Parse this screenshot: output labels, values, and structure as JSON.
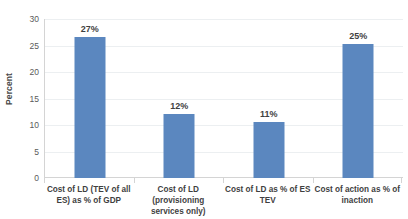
{
  "chart_data": {
    "type": "bar",
    "title": "",
    "xlabel": "",
    "ylabel": "Percent",
    "ylim": [
      0,
      30
    ],
    "yticks": [
      0,
      5,
      10,
      15,
      20,
      25,
      30
    ],
    "ytick_labels": [
      "0",
      "5",
      "10",
      "15",
      "20",
      "25",
      "30"
    ],
    "grid": true,
    "legend": "none",
    "bar_color": "#5b87bf",
    "categories": [
      "Cost of LD (TEV of all ES) as % of GDP",
      "Cost of LD (provisioning services only)",
      "Cost of LD as % of ES TEV",
      "Cost of action as % of inaction"
    ],
    "category_lines": [
      [
        "Cost of LD (TEV of all",
        "ES) as % of GDP"
      ],
      [
        "Cost of LD (provisioning",
        "services only)"
      ],
      [
        "Cost of LD as % of ES",
        "TEV"
      ],
      [
        "Cost of action as % of",
        "inaction"
      ]
    ],
    "values": [
      26.7,
      12.1,
      10.6,
      25.2
    ],
    "data_labels": [
      "27%",
      "12%",
      "11%",
      "25%"
    ]
  }
}
